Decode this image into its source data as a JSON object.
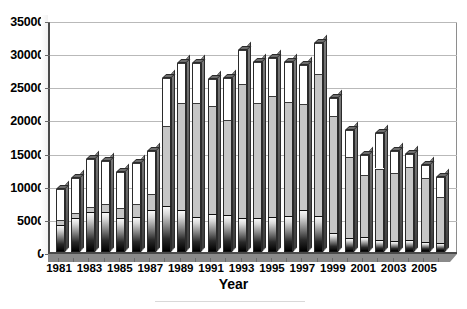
{
  "chart_data": {
    "type": "bar",
    "subtype": "stacked-column-3d",
    "title": "",
    "xlabel": "Year",
    "ylabel": "",
    "ylim": [
      0,
      35000
    ],
    "ytick_step": 5000,
    "yticks": [
      "0",
      "5000",
      "10000",
      "15000",
      "20000",
      "25000",
      "30000",
      "35000"
    ],
    "grid": true,
    "legend": false,
    "legend_position": "none",
    "categories": [
      "1981",
      "1982",
      "1983",
      "1984",
      "1985",
      "1986",
      "1987",
      "1988",
      "1989",
      "1990",
      "1991",
      "1992",
      "1993",
      "1994",
      "1995",
      "1996",
      "1997",
      "1998",
      "1999",
      "2000",
      "2001",
      "2002",
      "2003",
      "2004",
      "2005",
      "2006"
    ],
    "xtick_labels": [
      "1981",
      "1983",
      "1985",
      "1987",
      "1989",
      "1991",
      "1993",
      "1995",
      "1997",
      "1999",
      "2001",
      "2003",
      "2005"
    ],
    "series": [
      {
        "name": "bottom-segment",
        "color": "#000000",
        "values": [
          4100,
          5200,
          6100,
          6100,
          5200,
          5300,
          6400,
          7000,
          6300,
          5300,
          5700,
          5600,
          5100,
          5200,
          5300,
          5500,
          6400,
          5500,
          2900,
          2100,
          2200,
          1800,
          1700,
          1800,
          1500,
          1400
        ]
      },
      {
        "name": "middle-segment",
        "color": "#c6c6c6",
        "values": [
          700,
          700,
          700,
          1100,
          1400,
          1900,
          2400,
          12000,
          16200,
          17200,
          16300,
          14300,
          20300,
          17300,
          18200,
          17200,
          15900,
          21300,
          17600,
          12300,
          9400,
          10800,
          10200,
          11000,
          9700,
          6900
        ]
      },
      {
        "name": "top-segment",
        "color": "#ffffff",
        "values": [
          4700,
          5300,
          7200,
          6600,
          5400,
          6200,
          6500,
          7200,
          6000,
          6000,
          4100,
          6300,
          5100,
          6200,
          5800,
          6000,
          5900,
          4700,
          2700,
          4000,
          3000,
          5300,
          3300,
          2000,
          1900,
          3000
        ]
      }
    ],
    "totals": [
      9500,
      11200,
      14000,
      13800,
      12000,
      13400,
      15300,
      26200,
      28500,
      28500,
      26100,
      26200,
      30500,
      28700,
      29300,
      28700,
      28200,
      31500,
      23200,
      18400,
      14600,
      17900,
      15200,
      14800,
      13100,
      11300
    ]
  }
}
